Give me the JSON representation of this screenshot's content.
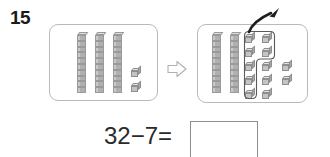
{
  "problem": {
    "number": "15",
    "equation_text": "32−7=",
    "minuend": 32,
    "subtrahend": 7,
    "answer_value": "",
    "answer_placeholder": ""
  },
  "panels": {
    "left": {
      "name": "starting-quantity-panel",
      "total": 32,
      "rods": 3,
      "rod_value": 10,
      "loose_cubes": 2
    },
    "right": {
      "name": "decomposed-quantity-panel",
      "rods": 2,
      "rod_value": 10,
      "decomposed_rod_cubes": 10,
      "loose_cubes": 2,
      "removed_cubes": 7,
      "lasso_column_one_cubes": 5,
      "lasso_column_two_cubes": 2
    }
  },
  "icons": {
    "transition_arrow": "right-arrow-icon",
    "takeaway_arrow": "curved-up-right-arrow-icon",
    "lasso": "selection-lasso-icon",
    "rod": "ten-rod-icon",
    "cube": "unit-cube-icon"
  },
  "colors": {
    "panel_border": "#b9b9b9",
    "cube_face": "#c4c4c4",
    "cube_top": "#e2e2e2",
    "cube_side": "#a8a8a8",
    "rod_fill": "#b0b0b0",
    "ink": "#2a2a2a",
    "outline": "#555555"
  }
}
